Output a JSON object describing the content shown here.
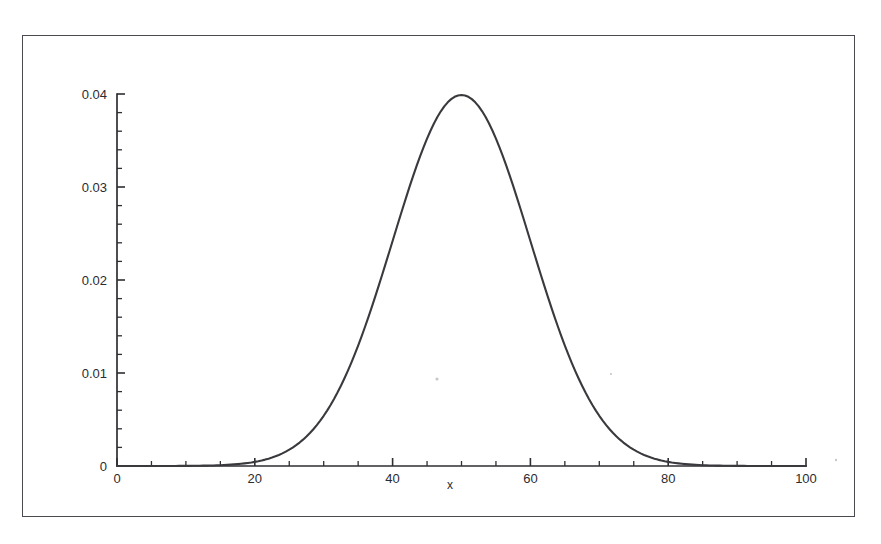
{
  "page": {
    "cropped_top_text": "",
    "background_color": "#ffffff"
  },
  "figure": {
    "frame_color": "#4a4a50",
    "curve_color": "#3a3a3e",
    "axis_color": "#2e2e33"
  },
  "chart_data": {
    "type": "line",
    "title": "",
    "subtitle": "",
    "xlabel": "x",
    "ylabel": "",
    "xlim": [
      0,
      100
    ],
    "ylim": [
      0,
      0.04
    ],
    "xticks": [
      0,
      20,
      40,
      60,
      80,
      100
    ],
    "xtick_labels": [
      "0",
      "20",
      "40",
      "60",
      "80",
      "100"
    ],
    "x_minor_tick_step": 5,
    "yticks": [
      0,
      0.01,
      0.02,
      0.03,
      0.04
    ],
    "ytick_labels": [
      "0",
      "0.01",
      "0.02",
      "0.03",
      "0.04"
    ],
    "y_minor_tick_step": 0.002,
    "grid": false,
    "legend": null,
    "distribution": {
      "name": "normal",
      "mean": 50,
      "std_dev": 10,
      "peak_value": 0.0399
    },
    "series": [
      {
        "name": "normal pdf (mu=50, sigma=10)",
        "x": [
          0,
          2,
          4,
          6,
          8,
          10,
          12,
          14,
          16,
          18,
          20,
          22,
          24,
          26,
          28,
          30,
          32,
          34,
          36,
          38,
          40,
          42,
          44,
          46,
          48,
          50,
          52,
          54,
          56,
          58,
          60,
          62,
          64,
          66,
          68,
          70,
          72,
          74,
          76,
          78,
          80,
          82,
          84,
          86,
          88,
          90,
          92,
          94,
          96,
          98,
          100
        ],
        "values": [
          0.0,
          0.0,
          0.0,
          0.0,
          0.0,
          0.0,
          0.0,
          0.0,
          0.0001,
          0.0001,
          0.0004,
          0.0008,
          0.0018,
          0.0036,
          0.0066,
          0.0108,
          0.0158,
          0.0208,
          0.0254,
          0.029,
          0.031,
          0.0312,
          0.0295,
          0.0266,
          0.023,
          0.0399,
          0.023,
          0.0266,
          0.0295,
          0.0312,
          0.031,
          0.029,
          0.0254,
          0.0208,
          0.0158,
          0.0108,
          0.0066,
          0.0036,
          0.0018,
          0.0008,
          0.0004,
          0.0001,
          0.0001,
          0.0,
          0.0,
          0.0,
          0.0,
          0.0,
          0.0,
          0.0,
          0.0
        ]
      }
    ],
    "annotations": []
  }
}
